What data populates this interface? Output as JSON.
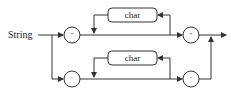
{
  "diagram": {
    "type": "syntax-diagram",
    "title": "String",
    "colors": {
      "stroke": "#333333",
      "text": "#222222",
      "background": "#ffffff"
    },
    "paths": [
      {
        "name": "double-quoted",
        "start_terminal": "\"",
        "loop_item": "char",
        "end_terminal": "\""
      },
      {
        "name": "single-quoted",
        "start_terminal": "'",
        "loop_item": "char",
        "end_terminal": "'"
      }
    ]
  }
}
